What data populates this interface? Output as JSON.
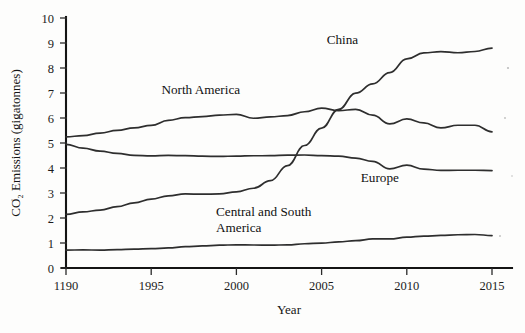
{
  "chart_data": {
    "type": "line",
    "title": "",
    "xlabel": "Year",
    "ylabel": "CO₂ Emissions (gigatonnes)",
    "xlim": [
      1990,
      2015
    ],
    "ylim": [
      0,
      10
    ],
    "grid": false,
    "legend_position": "inline-labels",
    "x_tick_labels": [
      "1190",
      "1995",
      "2000",
      "2005",
      "2010",
      "2015"
    ],
    "x_tick_values": [
      1990,
      1995,
      2000,
      2005,
      2010,
      2015
    ],
    "y_tick_labels": [
      "0",
      "1",
      "2",
      "3",
      "4",
      "5",
      "6",
      "7",
      "8",
      "9",
      "10"
    ],
    "y_tick_values": [
      0,
      1,
      2,
      3,
      4,
      5,
      6,
      7,
      8,
      9,
      10
    ],
    "x": [
      1990,
      1991,
      1992,
      1993,
      1994,
      1995,
      1996,
      1997,
      1998,
      1999,
      2000,
      2001,
      2002,
      2003,
      2004,
      2005,
      2006,
      2007,
      2008,
      2009,
      2010,
      2011,
      2012,
      2013,
      2014,
      2015
    ],
    "series": [
      {
        "name": "China",
        "label": "China",
        "label_x": 2005.3,
        "label_y": 8.95,
        "color": "#2e2e2e",
        "values": [
          2.15,
          2.25,
          2.32,
          2.45,
          2.6,
          2.75,
          2.88,
          2.95,
          2.95,
          2.95,
          3.05,
          3.2,
          3.5,
          4.1,
          4.9,
          5.6,
          6.35,
          7.0,
          7.35,
          7.8,
          8.35,
          8.6,
          8.65,
          8.6,
          8.65,
          8.8
        ],
        "notes": "Rises steeply after 2002, crosses Europe near 2002 and North America near 2005-2006, plateaus near 8.6-8.8 after 2011"
      },
      {
        "name": "North America",
        "label": "North America",
        "label_x": 1995.6,
        "label_y": 6.95,
        "color": "#2e2e2e",
        "values": [
          5.25,
          5.3,
          5.4,
          5.5,
          5.6,
          5.7,
          5.9,
          6.0,
          6.05,
          6.1,
          6.15,
          6.0,
          6.05,
          6.1,
          6.25,
          6.4,
          6.3,
          6.35,
          6.1,
          5.75,
          5.95,
          5.8,
          5.6,
          5.7,
          5.7,
          5.45
        ],
        "notes": "Gradual rise to peak ~6.4 around 2005-2007, then decline with wobble to ~5.45 by 2015"
      },
      {
        "name": "Europe",
        "label": "Europe",
        "label_x": 2007.3,
        "label_y": 3.45,
        "color": "#2e2e2e",
        "values": [
          4.95,
          4.8,
          4.68,
          4.58,
          4.5,
          4.48,
          4.5,
          4.48,
          4.47,
          4.45,
          4.48,
          4.5,
          4.5,
          4.52,
          4.52,
          4.5,
          4.48,
          4.4,
          4.25,
          3.95,
          4.1,
          3.95,
          3.9,
          3.9,
          3.9,
          3.9
        ],
        "notes": "Declines from 4.95 in 1990, flat near 4.5 through 2006, drops after 2007 to ~3.9 and flat to 2015"
      },
      {
        "name": "Central and South America",
        "label_line1": "Central and South",
        "label_line2": "America",
        "label_x": 1998.8,
        "label_y": 2.1,
        "color": "#2e2e2e",
        "values": [
          0.72,
          0.73,
          0.72,
          0.73,
          0.75,
          0.77,
          0.8,
          0.84,
          0.88,
          0.9,
          0.93,
          0.93,
          0.92,
          0.93,
          0.97,
          1.0,
          1.05,
          1.1,
          1.15,
          1.15,
          1.22,
          1.27,
          1.3,
          1.32,
          1.33,
          1.3
        ],
        "notes": "Slow steady rise from 0.72 to about 1.3"
      }
    ]
  },
  "axes": {
    "y_title": "CO₂ Emissions (gigatonnes)",
    "x_title": "Year"
  }
}
